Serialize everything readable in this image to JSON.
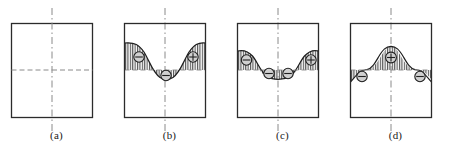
{
  "figure": {
    "title": "",
    "background_color": "#ffffff",
    "line_color": "#2b2b2b",
    "fill_color": "#c9c9c9",
    "hatch_color": "#555555",
    "centerline_color": "#888888",
    "midline_color": "#888888",
    "panel_count": 4
  },
  "panels": [
    {
      "label": "(a)",
      "name": "panel-a",
      "description": "empty rectangle with vertical dash-dot centerline and horizontal dashed midline",
      "has_curve": false,
      "symbols": []
    },
    {
      "label": "(b)",
      "name": "panel-b",
      "description": "curve high at both edges, deep valley at center",
      "has_curve": true,
      "symbols": [
        {
          "glyph": "⊖",
          "sign": "minus",
          "position": "left"
        },
        {
          "glyph": "⊖",
          "sign": "minus",
          "position": "center"
        },
        {
          "glyph": "⊕",
          "sign": "plus",
          "position": "right"
        }
      ]
    },
    {
      "label": "(c)",
      "name": "panel-c",
      "description": "curve with raised edges and a broad shallow basin across the middle",
      "has_curve": true,
      "symbols": [
        {
          "glyph": "⊖",
          "sign": "minus",
          "position": "left"
        },
        {
          "glyph": "⊖",
          "sign": "minus",
          "position": "center-left"
        },
        {
          "glyph": "⊖",
          "sign": "minus",
          "position": "center-right"
        },
        {
          "glyph": "⊕",
          "sign": "plus",
          "position": "right"
        }
      ]
    },
    {
      "label": "(d)",
      "name": "panel-d",
      "description": "central hump rising above the midline with low wings at both edges",
      "has_curve": true,
      "symbols": [
        {
          "glyph": "⊕",
          "sign": "plus",
          "position": "center"
        },
        {
          "glyph": "⊖",
          "sign": "minus",
          "position": "left"
        },
        {
          "glyph": "⊖",
          "sign": "minus",
          "position": "right"
        }
      ]
    }
  ],
  "labels": {
    "a": "(a)",
    "b": "(b)",
    "c": "(c)",
    "d": "(d)"
  }
}
